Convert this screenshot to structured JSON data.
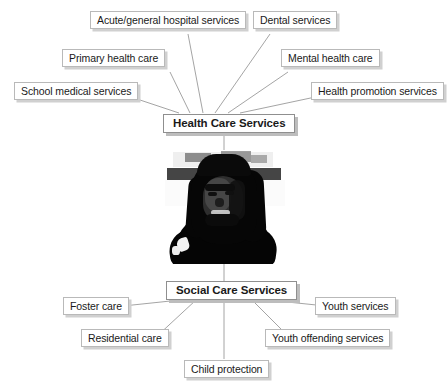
{
  "diagram": {
    "background_color": "#ffffff",
    "box_fill": "#ffffff",
    "box_border_color": "#b9b9b9",
    "box_shadow_color": "#d0d0d0",
    "connector_color": "#9a9a9a",
    "text_color": "#1a1a1a"
  },
  "center_image": {
    "alt": "Black and white high-contrast photograph of a young person with dreadlocks",
    "name": "central-portrait-photo"
  },
  "hubs": [
    {
      "id": "health-care-services",
      "label": "Health Care Services",
      "position": "top"
    },
    {
      "id": "social-care-services",
      "label": "Social Care Services",
      "position": "bottom"
    }
  ],
  "health_care_leaves": [
    {
      "id": "school-medical-services",
      "label": "School medical services"
    },
    {
      "id": "primary-health-care",
      "label": "Primary health care"
    },
    {
      "id": "acute-general-hospital-services",
      "label": "Acute/general hospital services"
    },
    {
      "id": "dental-services",
      "label": "Dental services"
    },
    {
      "id": "mental-health-care",
      "label": "Mental health care"
    },
    {
      "id": "health-promotion-services",
      "label": "Health promotion services"
    }
  ],
  "social_care_leaves": [
    {
      "id": "foster-care",
      "label": "Foster care"
    },
    {
      "id": "residential-care",
      "label": "Residential care"
    },
    {
      "id": "child-protection",
      "label": "Child protection"
    },
    {
      "id": "youth-offending-services",
      "label": "Youth offending services"
    },
    {
      "id": "youth-services",
      "label": "Youth services"
    }
  ]
}
